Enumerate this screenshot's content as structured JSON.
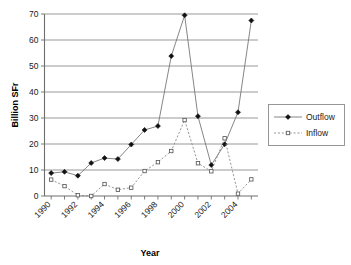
{
  "chart_data": {
    "type": "line",
    "title": "",
    "xlabel": "Year",
    "ylabel": "Billion SFr",
    "x": [
      1990,
      1991,
      1992,
      1993,
      1994,
      1995,
      1996,
      1997,
      1998,
      1999,
      2000,
      2001,
      2002,
      2003,
      2004,
      2005
    ],
    "xlim": [
      1989.5,
      2005.5
    ],
    "ylim": [
      0,
      70
    ],
    "yticks": [
      0,
      10,
      20,
      30,
      40,
      50,
      60,
      70
    ],
    "ytick_labels": [
      "0",
      "10",
      "20",
      "30",
      "40",
      "50",
      "60",
      "70"
    ],
    "xtick_labels": [
      "1990",
      "1992",
      "1994",
      "1996",
      "1998",
      "2000",
      "2002",
      "2004"
    ],
    "xtick_values": [
      1990,
      1992,
      1994,
      1996,
      1998,
      2000,
      2002,
      2004
    ],
    "xtick_rotation": 45,
    "grid": "horizontal",
    "legend_position": "right",
    "series": [
      {
        "name": "Outflow",
        "marker": "filled-diamond",
        "linestyle": "solid",
        "color": "#111111",
        "values": [
          8.8,
          9.3,
          7.8,
          12.7,
          14.6,
          14.2,
          19.8,
          25.4,
          26.9,
          53.8,
          69.5,
          30.7,
          11.9,
          19.9,
          32.2,
          67.5
        ]
      },
      {
        "name": "Inflow",
        "marker": "open-square",
        "linestyle": "dotted",
        "color": "#5a5a5a",
        "values": [
          6.3,
          3.8,
          0.3,
          0.0,
          4.6,
          2.4,
          3.2,
          9.6,
          13.0,
          17.3,
          29.2,
          12.6,
          9.5,
          22.2,
          0.9,
          6.4
        ]
      }
    ]
  },
  "legend": {
    "items": [
      {
        "label": "Outflow"
      },
      {
        "label": "Inflow"
      }
    ]
  }
}
